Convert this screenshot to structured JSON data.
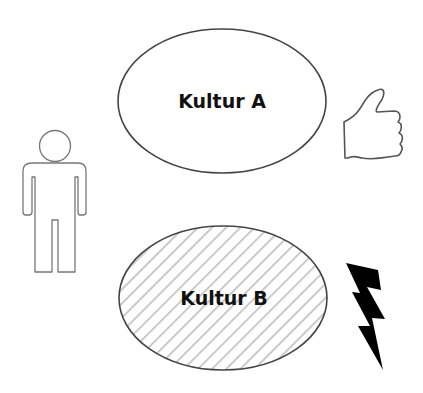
{
  "diagram": {
    "culture_a": {
      "label": "Kultur A",
      "fill": "#ffffff",
      "stroke": "#444444",
      "pattern": "none"
    },
    "culture_b": {
      "label": "Kultur B",
      "fill": "#ffffff",
      "stroke": "#444444",
      "pattern": "diagonal-hatch",
      "hatch_color": "#bdbdbd"
    },
    "person": {
      "icon": "person-outline-icon",
      "stroke": "#777777"
    },
    "approval": {
      "icon": "thumbs-up-icon",
      "stroke": "#555555"
    },
    "conflict": {
      "icon": "lightning-bolt-icon",
      "fill": "#000000"
    }
  }
}
